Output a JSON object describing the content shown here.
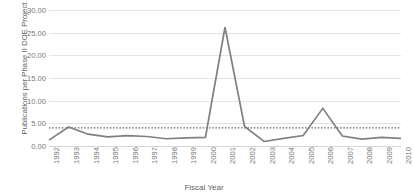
{
  "chart_data": {
    "type": "line",
    "title": "",
    "xlabel": "Fiscal Year",
    "ylabel": "Publications per Phase II DOE Project",
    "categories": [
      "1992",
      "1993",
      "1994",
      "1995",
      "1996",
      "1997",
      "1998",
      "1999",
      "2000",
      "2001",
      "2002",
      "2003",
      "2004",
      "2005",
      "2006",
      "2007",
      "2008",
      "2009",
      "2010"
    ],
    "series": [
      {
        "name": "Publications per Phase II DOE Project",
        "color": "#808080",
        "style": "solid",
        "values": [
          1.3,
          4.2,
          2.6,
          2.0,
          2.3,
          2.1,
          1.6,
          1.8,
          1.9,
          26.2,
          4.3,
          1.0,
          1.7,
          2.3,
          8.3,
          2.2,
          1.5,
          1.9,
          1.7
        ]
      }
    ],
    "reference_line": {
      "name": "Average",
      "value": 4.0,
      "style": "dotted",
      "color": "#6f6f6f"
    },
    "ylim": [
      0,
      30
    ],
    "ytick_values": [
      0,
      5,
      10,
      15,
      20,
      25,
      30
    ],
    "ytick_labels": [
      "0.00",
      "5.00",
      "10.00",
      "15.00",
      "20.00",
      "25.00",
      "30.00"
    ],
    "grid": true,
    "legend": "none",
    "xtick_rotation": -90
  }
}
